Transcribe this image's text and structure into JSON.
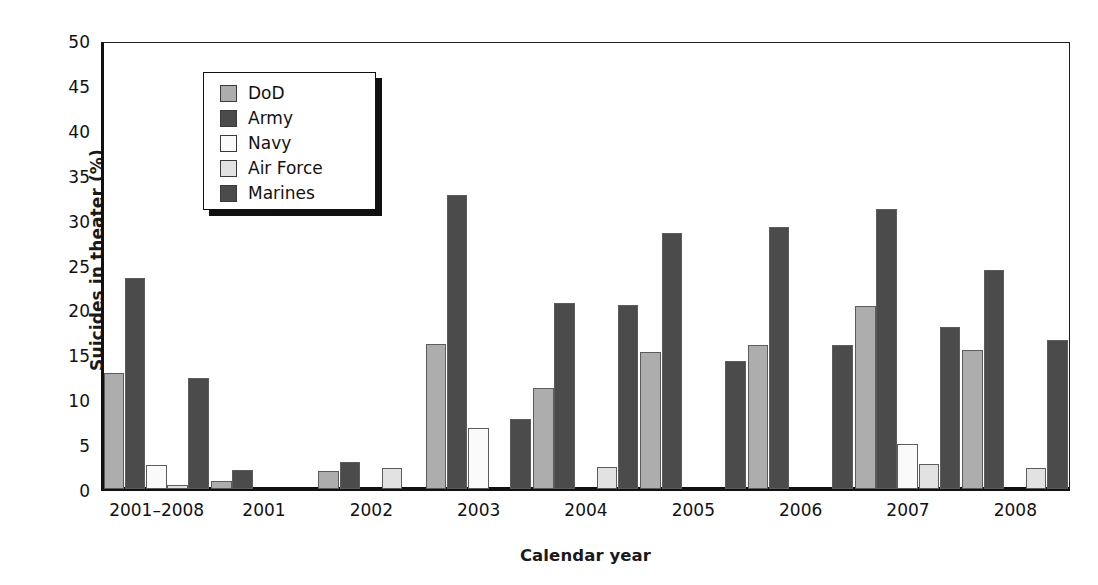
{
  "chart_data": {
    "type": "bar",
    "title": "",
    "xlabel": "Calendar year",
    "ylabel": "Suicides in theater (%)",
    "ylim": [
      0,
      50
    ],
    "ytick_step": 5,
    "yticks": [
      "0",
      "5",
      "10",
      "15",
      "20",
      "25",
      "30",
      "35",
      "40",
      "45",
      "50"
    ],
    "grid": false,
    "legend_position": "upper-left-inside",
    "categories": [
      "2001–2008",
      "2001",
      "2002",
      "2003",
      "2004",
      "2005",
      "2006",
      "2007",
      "2008"
    ],
    "series": [
      {
        "name": "DoD",
        "color": "#adadad",
        "values": [
          13.0,
          0.9,
          2.0,
          16.3,
          11.3,
          15.4,
          16.1,
          20.5,
          15.6
        ]
      },
      {
        "name": "Army",
        "color": "#4b4b4b",
        "values": [
          23.7,
          2.1,
          3.0,
          33.0,
          20.8,
          28.7,
          29.4,
          31.4,
          24.5
        ]
      },
      {
        "name": "Navy",
        "color": "#fafafa",
        "values": [
          2.7,
          null,
          null,
          6.8,
          null,
          null,
          null,
          5.0,
          null
        ]
      },
      {
        "name": "Air Force",
        "color": "#e2e2e2",
        "values": [
          0.4,
          null,
          2.3,
          null,
          2.5,
          null,
          null,
          2.8,
          2.4
        ]
      },
      {
        "name": "Marines",
        "color": "#4b4b4b",
        "values": [
          12.5,
          null,
          null,
          7.8,
          20.6,
          14.3,
          16.1,
          18.2,
          16.7
        ]
      }
    ]
  },
  "legend": {
    "items": [
      {
        "label": "DoD",
        "color": "#adadad"
      },
      {
        "label": "Army",
        "color": "#4b4b4b"
      },
      {
        "label": "Navy",
        "color": "#fafafa"
      },
      {
        "label": "Air Force",
        "color": "#e2e2e2"
      },
      {
        "label": "Marines",
        "color": "#4b4b4b"
      }
    ]
  }
}
